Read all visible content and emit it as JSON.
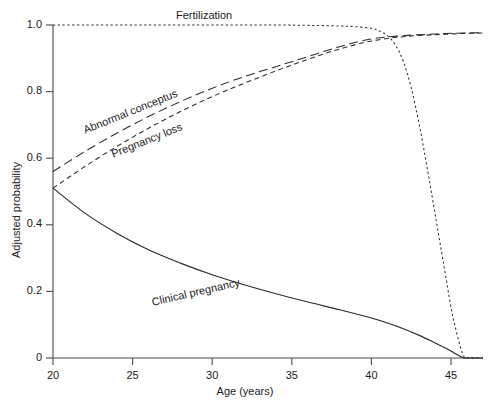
{
  "chart_data": {
    "type": "line",
    "title": "",
    "xlabel": "Age (years)",
    "ylabel": "Adjusted probability",
    "xlim": [
      20,
      47
    ],
    "ylim": [
      0,
      1.0
    ],
    "grid": false,
    "legend_position": "inline-annotations",
    "xticks": [
      20,
      25,
      30,
      35,
      40,
      45
    ],
    "xtick_labels": [
      "20",
      "25",
      "30",
      "35",
      "40",
      "45"
    ],
    "yticks": [
      0,
      0.2,
      0.4,
      0.6,
      0.8,
      1.0
    ],
    "ytick_labels": [
      "0",
      "0.2",
      "0.4",
      "0.6",
      "0.8",
      "1.0"
    ],
    "series": [
      {
        "name": "Fertilization",
        "style": "dotted",
        "color": "#2b2b2b",
        "label_text": "Fertilization",
        "x": [
          20,
          22,
          24,
          26,
          28,
          30,
          32,
          34,
          36,
          38,
          39,
          40,
          40.5,
          41,
          41.5,
          42,
          42.5,
          43,
          43.5,
          44,
          44.5,
          45,
          45.3,
          45.6,
          45.8,
          46,
          47
        ],
        "values": [
          1.0,
          1.0,
          1.0,
          1.0,
          1.0,
          1.0,
          1.0,
          1.0,
          0.999,
          0.997,
          0.995,
          0.99,
          0.982,
          0.968,
          0.94,
          0.89,
          0.81,
          0.7,
          0.57,
          0.43,
          0.29,
          0.15,
          0.085,
          0.03,
          0.005,
          0.0,
          0.0
        ]
      },
      {
        "name": "Abnormal conceptus",
        "style": "long-dash",
        "color": "#2b2b2b",
        "label_text": "Abnormal conceptus",
        "x": [
          20,
          22,
          24,
          26,
          28,
          30,
          32,
          34,
          36,
          38,
          40,
          42,
          44,
          45,
          46,
          47
        ],
        "values": [
          0.56,
          0.62,
          0.675,
          0.725,
          0.77,
          0.81,
          0.845,
          0.875,
          0.905,
          0.935,
          0.958,
          0.968,
          0.973,
          0.975,
          0.976,
          0.977
        ]
      },
      {
        "name": "Pregnancy loss",
        "style": "short-dash",
        "color": "#2b2b2b",
        "label_text": "Pregnancy loss",
        "x": [
          20,
          22,
          24,
          26,
          28,
          30,
          32,
          34,
          36,
          38,
          40,
          42,
          44,
          45,
          46,
          47
        ],
        "values": [
          0.51,
          0.575,
          0.635,
          0.69,
          0.74,
          0.785,
          0.825,
          0.862,
          0.897,
          0.928,
          0.952,
          0.965,
          0.971,
          0.973,
          0.975,
          0.976
        ]
      },
      {
        "name": "Clinical pregnancy",
        "style": "solid",
        "color": "#2b2b2b",
        "label_text": "Clinical pregnancy",
        "x": [
          20,
          22,
          24,
          26,
          28,
          30,
          32,
          34,
          36,
          38,
          40,
          41,
          42,
          43,
          44,
          44.8,
          45.3,
          45.8,
          46,
          47
        ],
        "values": [
          0.51,
          0.435,
          0.375,
          0.325,
          0.285,
          0.25,
          0.22,
          0.193,
          0.168,
          0.145,
          0.12,
          0.105,
          0.088,
          0.068,
          0.045,
          0.026,
          0.012,
          0.0,
          0.0,
          0.0
        ]
      }
    ]
  },
  "axes": {
    "x_title": "Age (years)",
    "y_title": "Adjusted probability",
    "x_tick_labels": [
      "20",
      "25",
      "30",
      "35",
      "40",
      "45"
    ],
    "y_tick_labels": [
      "1.0",
      "0.8",
      "0.6",
      "0.4",
      "0.2",
      "0"
    ]
  },
  "annotations": {
    "fertilization": "Fertilization",
    "abnormal_conceptus": "Abnormal conceptus",
    "pregnancy_loss": "Pregnancy loss",
    "clinical_pregnancy": "Clinical pregnancy"
  }
}
